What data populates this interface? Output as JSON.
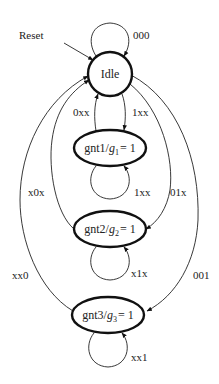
{
  "diagram": {
    "type": "finite-state-machine",
    "reset_label": "Reset",
    "states": [
      {
        "id": "idle",
        "label": "Idle"
      },
      {
        "id": "gnt1",
        "name": "gnt1",
        "sep": "/",
        "var": "g",
        "sub": "1",
        "eq": "= 1"
      },
      {
        "id": "gnt2",
        "name": "gnt2",
        "sep": "/",
        "var": "g",
        "sub": "2",
        "eq": "= 1"
      },
      {
        "id": "gnt3",
        "name": "gnt3",
        "sep": "/",
        "var": "g",
        "sub": "3",
        "eq": "= 1"
      }
    ],
    "transitions": [
      {
        "from": "idle",
        "to": "idle",
        "label": "000"
      },
      {
        "from": "idle",
        "to": "gnt1",
        "label": "1xx"
      },
      {
        "from": "gnt1",
        "to": "idle",
        "label": "0xx"
      },
      {
        "from": "gnt1",
        "to": "gnt1",
        "label": "1xx"
      },
      {
        "from": "idle",
        "to": "gnt2",
        "label": "01x"
      },
      {
        "from": "gnt2",
        "to": "idle",
        "label": "x0x"
      },
      {
        "from": "gnt2",
        "to": "gnt2",
        "label": "x1x"
      },
      {
        "from": "idle",
        "to": "gnt3",
        "label": "001"
      },
      {
        "from": "gnt3",
        "to": "idle",
        "label": "xx0"
      },
      {
        "from": "gnt3",
        "to": "gnt3",
        "label": "xx1"
      }
    ]
  }
}
